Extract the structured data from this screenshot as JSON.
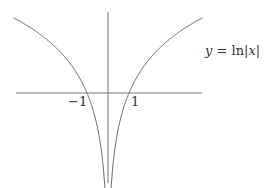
{
  "chart_data": {
    "type": "line",
    "title": "",
    "function": "y = ln|x|",
    "legend": [
      "y = ln|x|"
    ],
    "xlabel": "",
    "ylabel": "",
    "x_ticks": [
      {
        "value": -1,
        "label": "−1"
      },
      {
        "value": 1,
        "label": "1"
      }
    ],
    "xlim": [
      -4.4,
      4.5
    ],
    "ylim": [
      -1.8,
      1.6
    ],
    "grid": false,
    "series": [
      {
        "name": "y = ln|x| (x<0)",
        "x": [
          -4.5,
          -3,
          -2,
          -1.5,
          -1,
          -0.7,
          -0.5,
          -0.3,
          -0.2,
          -0.15
        ],
        "y": [
          1.5,
          1.1,
          0.69,
          0.41,
          0,
          -0.36,
          -0.69,
          -1.2,
          -1.61,
          -1.8
        ]
      },
      {
        "name": "y = ln|x| (x>0)",
        "x": [
          0.15,
          0.2,
          0.3,
          0.5,
          0.7,
          1,
          1.5,
          2,
          3,
          4.5
        ],
        "y": [
          -1.8,
          -1.61,
          -1.2,
          -0.69,
          -0.36,
          0,
          0.41,
          0.69,
          1.1,
          1.5
        ]
      }
    ]
  },
  "labels": {
    "eq_y": "y",
    "eq_eq": " = ",
    "eq_ln": "ln",
    "eq_bar1": "|",
    "eq_x": "x",
    "eq_bar2": "|",
    "tick_neg1": "−1",
    "tick_1": "1"
  },
  "colors": {
    "axis": "#555555",
    "curve": "#555555"
  }
}
